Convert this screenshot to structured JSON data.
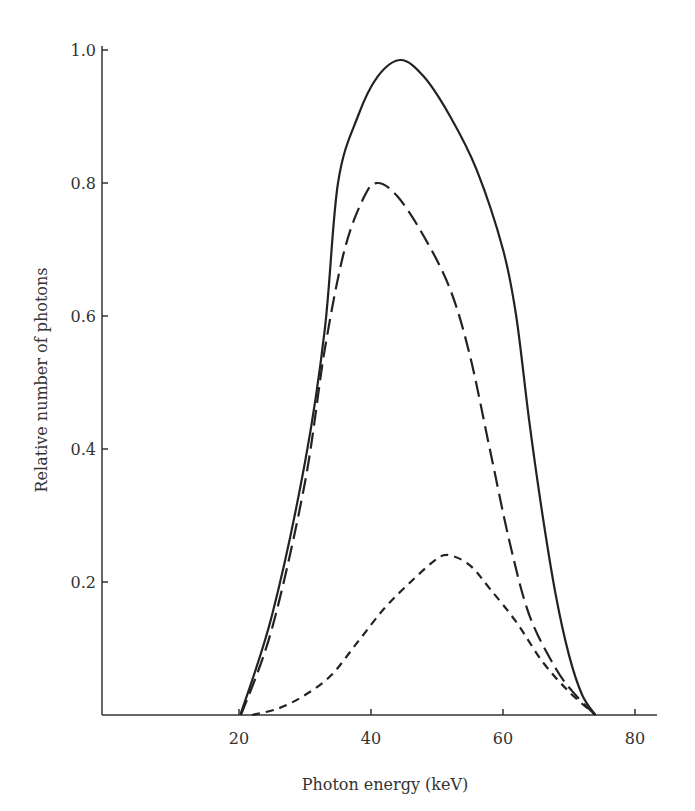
{
  "chart_data": {
    "type": "line",
    "title": "",
    "xlabel": "Photon energy (keV)",
    "ylabel": "Relative number of photons",
    "xlim": [
      0,
      84
    ],
    "ylim": [
      0,
      1.0
    ],
    "x_ticks": [
      20,
      40,
      60,
      80
    ],
    "x_tick_labels": [
      "20",
      "40",
      "60",
      "80"
    ],
    "y_ticks": [
      0.2,
      0.4,
      0.6,
      0.8,
      1.0
    ],
    "y_tick_labels": [
      "0.2",
      "0.4",
      "0.6",
      "0.8",
      "1.0"
    ],
    "grid": false,
    "legend": null,
    "series": [
      {
        "name": "solid",
        "style": "solid",
        "x": [
          20.2,
          25,
          30,
          33,
          35,
          38,
          41,
          44.5,
          48,
          52,
          56,
          60,
          62,
          64,
          66,
          68,
          70,
          72,
          74
        ],
        "y": [
          0,
          0.15,
          0.38,
          0.58,
          0.8,
          0.9,
          0.96,
          0.985,
          0.96,
          0.9,
          0.82,
          0.7,
          0.6,
          0.44,
          0.3,
          0.18,
          0.09,
          0.03,
          0
        ]
      },
      {
        "name": "long-dashed",
        "style": "long-dash",
        "x": [
          20.3,
          25,
          30,
          33,
          36,
          39,
          41,
          44,
          48,
          52,
          55,
          58,
          61,
          64,
          68,
          71,
          74
        ],
        "y": [
          0,
          0.13,
          0.35,
          0.55,
          0.7,
          0.78,
          0.8,
          0.78,
          0.72,
          0.64,
          0.54,
          0.4,
          0.26,
          0.15,
          0.07,
          0.03,
          0
        ]
      },
      {
        "name": "short-dashed",
        "style": "short-dash",
        "x": [
          22,
          26,
          30,
          34,
          38,
          42,
          46,
          50,
          52,
          55,
          58,
          62,
          66,
          70,
          74
        ],
        "y": [
          0,
          0.01,
          0.03,
          0.06,
          0.11,
          0.16,
          0.2,
          0.235,
          0.24,
          0.225,
          0.19,
          0.14,
          0.08,
          0.035,
          0
        ]
      }
    ]
  }
}
